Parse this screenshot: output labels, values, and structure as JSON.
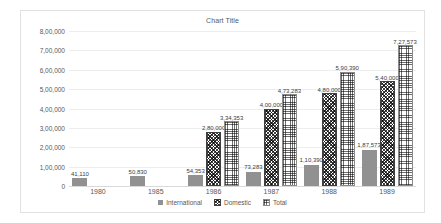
{
  "chart_data": {
    "type": "bar",
    "title": "Chart Title",
    "xlabel": "",
    "ylabel": "",
    "categories": [
      "1980",
      "1985",
      "1986",
      "1987",
      "1988",
      "1989"
    ],
    "series": [
      {
        "name": "International",
        "pattern": "solid-gray",
        "color": "#919191",
        "values": [
          41110,
          50830,
          54353,
          73283,
          110390,
          187573
        ],
        "labels": [
          "41,110",
          "50,830",
          "54,353",
          "73,283",
          "1,10,390",
          "1,87,573"
        ]
      },
      {
        "name": "Domestic",
        "pattern": "diagonal-crosshatch",
        "color": "#3f3f3f",
        "values": [
          null,
          null,
          280000,
          400000,
          480000,
          540000
        ],
        "labels": [
          "",
          "",
          "2,80,000",
          "4,00,000",
          "4,80,000",
          "5,40,000"
        ]
      },
      {
        "name": "Total",
        "pattern": "fine-grid",
        "color": "#8a8a8a",
        "values": [
          null,
          null,
          334353,
          473283,
          590390,
          727573
        ],
        "labels": [
          "",
          "",
          "3,34,353",
          "4,73,283",
          "5,90,390",
          "7,27,573"
        ]
      }
    ],
    "ylim": [
      0,
      800000
    ],
    "ytick_values": [
      0,
      100000,
      200000,
      300000,
      400000,
      500000,
      600000,
      700000,
      800000
    ],
    "ytick_labels": [
      "0",
      "1,00,000",
      "2,00,000",
      "3,00,000",
      "4,00,000",
      "5,00,000",
      "6,00,000",
      "7,00,000",
      "8,00,000"
    ],
    "grid": true,
    "legend_position": "bottom"
  }
}
